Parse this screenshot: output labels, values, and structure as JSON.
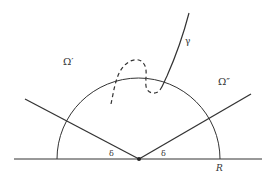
{
  "diagram": {
    "labels": {
      "omega_prime": "Ω′",
      "omega_double_prime": "Ω″",
      "gamma": "γ",
      "delta_left": "δ",
      "delta_right": "δ",
      "radius": "R"
    },
    "colors": {
      "stroke": "#333333",
      "background": "#ffffff"
    }
  }
}
